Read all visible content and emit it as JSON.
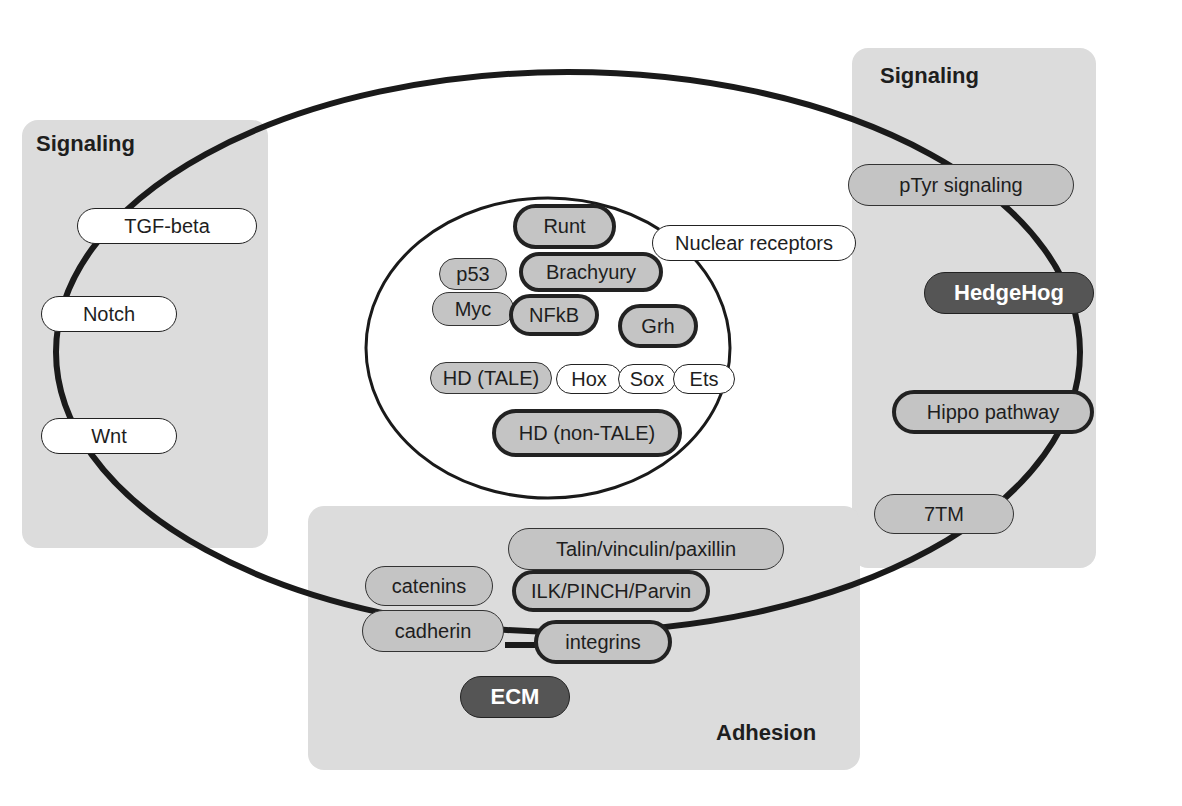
{
  "colors": {
    "panel_bg": "#dcdcdc",
    "pill_white": "#ffffff",
    "pill_grey": "#c4c4c4",
    "pill_dark": "#555555",
    "outline": "#1e1e1e"
  },
  "panels": {
    "left_signaling": {
      "title": "Signaling",
      "items": [
        "TGF-beta",
        "Notch",
        "Wnt"
      ]
    },
    "right_signaling": {
      "title": "Signaling",
      "items": [
        "pTyr signaling",
        "HedgeHog",
        "Hippo pathway",
        "7TM"
      ]
    },
    "adhesion": {
      "title": "Adhesion",
      "items": [
        "Talin/vinculin/paxillin",
        "catenins",
        "ILK/PINCH/Parvin",
        "cadherin",
        "integrins",
        "ECM"
      ]
    }
  },
  "nucleus": {
    "items": [
      "Runt",
      "Nuclear receptors",
      "p53",
      "Brachyury",
      "Myc",
      "NFkB",
      "Grh",
      "HD (TALE)",
      "Hox",
      "Sox",
      "Ets",
      "HD (non-TALE)"
    ]
  }
}
